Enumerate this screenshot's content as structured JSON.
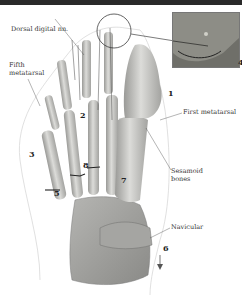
{
  "figure": {
    "labels": {
      "dorsal_digital": "Dorsal digital nn.",
      "fifth_metatarsal_1": "Fifth",
      "fifth_metatarsal_2": "metatarsal",
      "first_metatarsal": "First metatarsal",
      "sesamoid_1": "Sesamoid",
      "sesamoid_2": "bones",
      "navicular": "Navicular"
    },
    "numbers": {
      "n1": "1",
      "n2": "2",
      "n3": "3",
      "n4": "4",
      "n5": "5",
      "n6": "6",
      "n7": "7",
      "n8": "8"
    },
    "colors": {
      "bone": "#c9c9c6",
      "bone_shadow": "#8f8f8c",
      "outline": "#cfcfcf",
      "inset_bg": "#8d8d86",
      "header_bar": "#2a2a2a"
    }
  }
}
